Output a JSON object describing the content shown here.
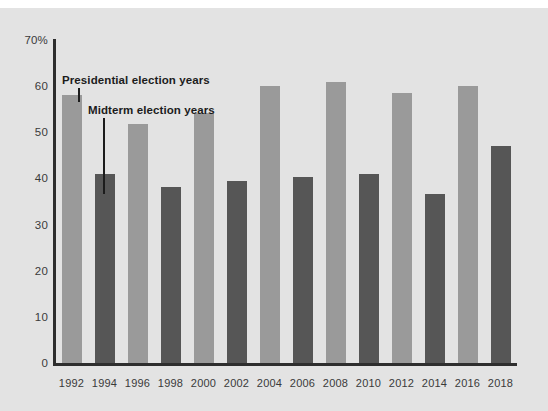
{
  "chart_data": {
    "type": "bar",
    "title": "",
    "subtitle": "",
    "xlabel": "",
    "ylabel": "",
    "ylim": [
      0,
      70
    ],
    "grid": false,
    "legend_position": "inline-annotation",
    "categories": [
      "1992",
      "1994",
      "1996",
      "1998",
      "2000",
      "2002",
      "2004",
      "2006",
      "2008",
      "2010",
      "2012",
      "2014",
      "2016",
      "2018"
    ],
    "y_ticks": [
      "0",
      "10",
      "20",
      "30",
      "40",
      "50",
      "60",
      "70%"
    ],
    "y_tick_values": [
      0,
      10,
      20,
      30,
      40,
      50,
      60,
      70
    ],
    "series": [
      {
        "name": "Presidential election years",
        "color": "#9a9a9a",
        "values": [
          58.0,
          null,
          51.7,
          null,
          54.2,
          null,
          60.1,
          null,
          61.0,
          null,
          58.6,
          null,
          60.1,
          null
        ]
      },
      {
        "name": "Midterm election years",
        "color": "#565656",
        "values": [
          null,
          41.0,
          null,
          38.1,
          null,
          39.5,
          null,
          40.4,
          null,
          41.0,
          null,
          36.7,
          null,
          47.0
        ]
      }
    ],
    "bars": [
      {
        "category": "1992",
        "value": 58.0,
        "type": "presidential"
      },
      {
        "category": "1994",
        "value": 41.0,
        "type": "midterm"
      },
      {
        "category": "1996",
        "value": 51.7,
        "type": "presidential"
      },
      {
        "category": "1998",
        "value": 38.1,
        "type": "midterm"
      },
      {
        "category": "2000",
        "value": 54.2,
        "type": "presidential"
      },
      {
        "category": "2002",
        "value": 39.5,
        "type": "midterm"
      },
      {
        "category": "2004",
        "value": 60.1,
        "type": "presidential"
      },
      {
        "category": "2006",
        "value": 40.4,
        "type": "midterm"
      },
      {
        "category": "2008",
        "value": 61.0,
        "type": "presidential"
      },
      {
        "category": "2010",
        "value": 41.0,
        "type": "midterm"
      },
      {
        "category": "2012",
        "value": 58.6,
        "type": "presidential"
      },
      {
        "category": "2014",
        "value": 36.7,
        "type": "midterm"
      },
      {
        "category": "2016",
        "value": 60.1,
        "type": "presidential"
      },
      {
        "category": "2018",
        "value": 47.0,
        "type": "midterm"
      }
    ],
    "annotations": [
      {
        "text": "Presidential election years",
        "points_to": "1992"
      },
      {
        "text": "Midterm election years",
        "points_to": "1994"
      }
    ]
  },
  "colors": {
    "panel_background": "#e3e3e3",
    "page_background": "#ffffff",
    "axis": "#2e2e2e",
    "presidential_bar": "#9a9a9a",
    "midterm_bar": "#565656",
    "text": "#1c1c1c",
    "tick_text": "#3a3a3a"
  }
}
